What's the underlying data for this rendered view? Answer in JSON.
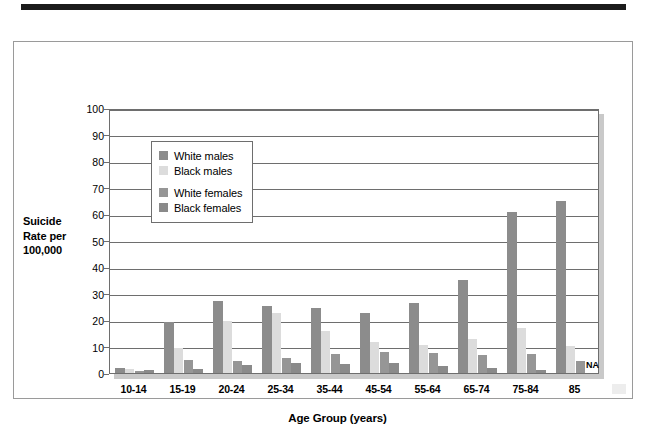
{
  "figure": {
    "y_axis_title_lines": [
      "Suicide",
      "Rate per",
      "100,000"
    ],
    "x_axis_title": "Age Group (years)",
    "na_note": "NA"
  },
  "legend": {
    "entries": [
      {
        "label": "White males",
        "color": "#8c8c8c"
      },
      {
        "label": "Black males",
        "color": "#dcdcdc"
      },
      {
        "label": "White females",
        "color": "#969696"
      },
      {
        "label": "Black females",
        "color": "#8a8a8a"
      }
    ]
  },
  "chart_data": {
    "type": "bar",
    "title": "",
    "xlabel": "Age Group (years)",
    "ylabel": "Suicide Rate per 100,000",
    "ylim": [
      0,
      100
    ],
    "yticks": [
      0,
      10,
      20,
      30,
      40,
      50,
      60,
      70,
      80,
      90,
      100
    ],
    "grid": true,
    "legend_position": "upper-left-inside",
    "categories": [
      "10-14",
      "15-19",
      "20-24",
      "25-34",
      "35-44",
      "45-54",
      "55-64",
      "65-74",
      "75-84",
      "85"
    ],
    "series": [
      {
        "name": "White males",
        "color": "#8c8c8c",
        "values": [
          2.0,
          19.2,
          27.0,
          25.3,
          24.6,
          22.5,
          26.5,
          35.0,
          60.8,
          65.0
        ]
      },
      {
        "name": "Black males",
        "color": "#dcdcdc",
        "values": [
          1.4,
          9.5,
          19.8,
          22.5,
          15.7,
          11.7,
          10.4,
          13.0,
          17.0,
          10.1
        ]
      },
      {
        "name": "White females",
        "color": "#969696",
        "values": [
          0.9,
          5.1,
          4.6,
          5.6,
          7.1,
          8.0,
          7.5,
          6.8,
          7.0,
          4.4
        ]
      },
      {
        "name": "Black females",
        "color": "#8a8a8a",
        "values": [
          1.1,
          1.6,
          3.0,
          3.8,
          3.5,
          3.8,
          2.5,
          1.9,
          1.2,
          null
        ]
      }
    ],
    "annotations": [
      {
        "text": "NA",
        "category": "85",
        "series": "Black females"
      }
    ]
  }
}
